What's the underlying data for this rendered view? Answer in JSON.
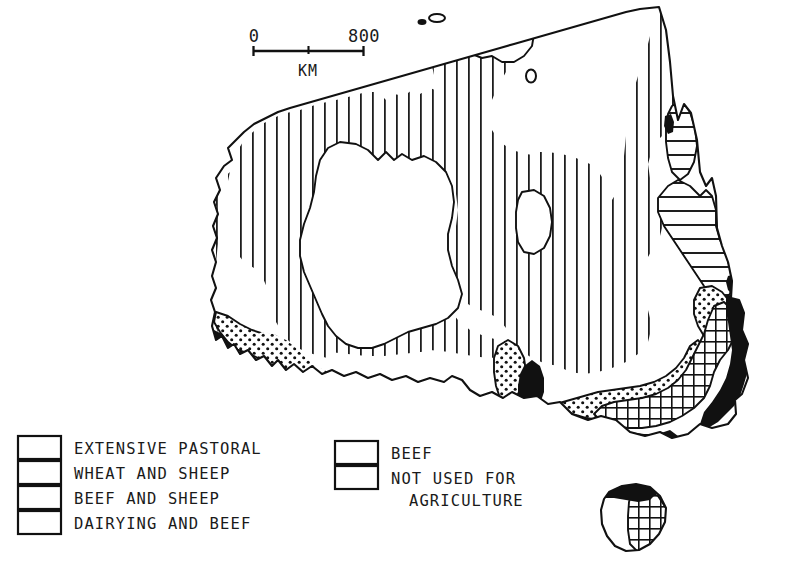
{
  "figure": {
    "background_color": "#ffffff",
    "ink_color": "#111111"
  },
  "scale_bar": {
    "min_label": "0",
    "max_label": "800",
    "unit_label": "KM",
    "min_value": 0,
    "max_value": 800,
    "tick_labels": [
      "0",
      "800"
    ],
    "midpoint_tick": true
  },
  "legend": {
    "columns": [
      {
        "name": "left-column",
        "items": [
          {
            "key": "extensive-pastoral",
            "label": "EXTENSIVE PASTORAL",
            "pattern": "vertical-lines"
          },
          {
            "key": "wheat-and-sheep",
            "label": "WHEAT AND SHEEP",
            "pattern": "dots"
          },
          {
            "key": "beef-and-sheep",
            "label": "BEEF AND SHEEP",
            "pattern": "grid"
          },
          {
            "key": "dairying-and-beef",
            "label": "DAIRYING AND BEEF",
            "pattern": "solid-black"
          }
        ]
      },
      {
        "name": "right-column",
        "items": [
          {
            "key": "beef",
            "label": "BEEF",
            "pattern": "horizontal-lines"
          },
          {
            "key": "not-used-for-agriculture",
            "label": "NOT USED FOR",
            "label_line2": "AGRICULTURE",
            "pattern": "blank"
          }
        ]
      }
    ]
  },
  "map_regions": {
    "extensive_pastoral": "Most of Western Australia, Northern Territory, South Australia interior and western Queensland / western New South Wales",
    "not_used_for_agriculture": "Central western deserts, Simpson Desert, Arnhem Land, Nullarbor coast strip, western Tasmania",
    "beef": "Cape York Peninsula and the north Queensland coastal band",
    "wheat_and_sheep": "Southwest Western Australia belt, Eyre Peninsula, Murray basin, Darling Downs",
    "beef_and_sheep": "Inner southwest Western Australia corner, southeast Victoria / NSW highlands, eastern Tasmania",
    "dairying_and_beef": "Southwest Western Australia corner, Gulf St Vincent, coastal Victoria, New South Wales coast, north Tasmania"
  }
}
